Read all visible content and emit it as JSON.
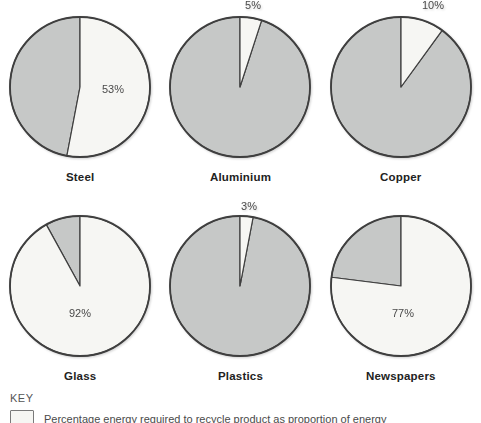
{
  "colors": {
    "light_fill": "#f6f6f3",
    "gray_fill": "#c6c8c7",
    "outline": "#3f3f3f",
    "percent_text": "#4a4a4a",
    "label_text": "#222222"
  },
  "chart_data": [
    {
      "type": "pie",
      "title": "Steel",
      "percent_label": "53%",
      "light_value": 53,
      "gray_value": 47,
      "label_placement": "inside",
      "label_dx": 33,
      "label_dy": 6
    },
    {
      "type": "pie",
      "title": "Aluminium",
      "percent_label": "5%",
      "light_value": 5,
      "gray_value": 95,
      "label_placement": "above",
      "label_dx": 13,
      "label_dy": -78
    },
    {
      "type": "pie",
      "title": "Copper",
      "percent_label": "10%",
      "light_value": 10,
      "gray_value": 90,
      "label_placement": "above",
      "label_dx": 32,
      "label_dy": -78
    },
    {
      "type": "pie",
      "title": "Glass",
      "percent_label": "92%",
      "light_value": 92,
      "gray_value": 8,
      "label_placement": "inside",
      "label_dx": 0,
      "label_dy": 31
    },
    {
      "type": "pie",
      "title": "Plastics",
      "percent_label": "3%",
      "light_value": 3,
      "gray_value": 97,
      "label_placement": "above",
      "label_dx": 9,
      "label_dy": -76
    },
    {
      "type": "pie",
      "title": "Newspapers",
      "percent_label": "77%",
      "light_value": 77,
      "gray_value": 23,
      "label_placement": "inside",
      "label_dx": 2,
      "label_dy": 31
    }
  ],
  "chart_layout": {
    "slice_start": "12-o-clock",
    "slice_direction": "clockwise",
    "light_slice_meaning": "percentage energy required to recycle product",
    "gray_slice_meaning": "remainder"
  },
  "key": {
    "heading": "KEY",
    "text": "Percentage energy required to recycle product as proportion of energy"
  }
}
